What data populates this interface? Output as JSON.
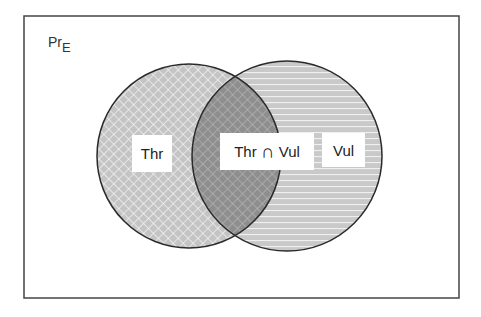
{
  "diagram": {
    "type": "venn",
    "universe_label": "Pr",
    "universe_subscript": "E",
    "sets": [
      {
        "id": "thr",
        "label": "Thr",
        "pattern": "crosshatch"
      },
      {
        "id": "vul",
        "label": "Vul",
        "pattern": "horizontal-lines"
      }
    ],
    "intersection": {
      "label_left": "Thr",
      "symbol": "∩",
      "label_right": "Vul"
    },
    "colors": {
      "border": "#333333",
      "fill_light": "#c8c8c8",
      "fill_dark": "#9a9a9a",
      "background": "#ffffff"
    }
  }
}
